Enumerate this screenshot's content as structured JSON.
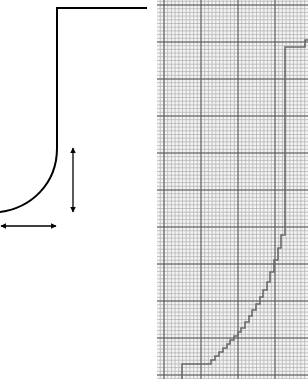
{
  "diagram": {
    "left_panel": {
      "description": "Smooth profile: horizontal top edge, vertical wall, rounded fillet curving into bottom",
      "stroke_color": "#000000",
      "profile": {
        "top_line": {
          "x1": 57,
          "y1": 8,
          "x2": 147,
          "y2": 8
        },
        "wall": {
          "x1": 57,
          "y1": 8,
          "x2": 57,
          "y2": 148
        },
        "fillet_end": {
          "x": 0,
          "y": 212
        }
      },
      "arrows": [
        {
          "name": "vertical-dimension-arrow",
          "orientation": "vertical",
          "x": 73,
          "y1": 146,
          "y2": 213
        },
        {
          "name": "horizontal-dimension-arrow",
          "orientation": "horizontal",
          "y": 226,
          "x1": 0,
          "x2": 57
        }
      ]
    },
    "right_panel": {
      "description": "Stepped (pixelated) approximation of the profile on graph paper",
      "grid": {
        "minor_color": "#b5b5b5",
        "major_color": "#555555",
        "minor_spacing": 3.7,
        "major_spacing": 37,
        "origin_x": 7,
        "origin_y": 5
      },
      "curve_color": "#6a6a6a",
      "stepped_curve": [
        [
          25,
          379
        ],
        [
          25,
          364
        ],
        [
          54,
          364
        ],
        [
          54,
          360
        ],
        [
          58,
          360
        ],
        [
          58,
          356
        ],
        [
          62,
          356
        ],
        [
          62,
          352
        ],
        [
          66,
          352
        ],
        [
          66,
          348
        ],
        [
          70,
          348
        ],
        [
          70,
          344
        ],
        [
          73,
          344
        ],
        [
          73,
          340
        ],
        [
          77,
          340
        ],
        [
          77,
          336
        ],
        [
          81,
          336
        ],
        [
          81,
          332
        ],
        [
          84,
          332
        ],
        [
          84,
          328
        ],
        [
          88,
          328
        ],
        [
          88,
          322
        ],
        [
          92,
          322
        ],
        [
          92,
          316
        ],
        [
          95,
          316
        ],
        [
          95,
          310
        ],
        [
          99,
          310
        ],
        [
          99,
          304
        ],
        [
          103,
          304
        ],
        [
          103,
          297
        ],
        [
          106,
          297
        ],
        [
          106,
          290
        ],
        [
          110,
          290
        ],
        [
          110,
          282
        ],
        [
          113,
          282
        ],
        [
          113,
          272
        ],
        [
          117,
          272
        ],
        [
          117,
          260
        ],
        [
          121,
          260
        ],
        [
          121,
          248
        ],
        [
          124,
          248
        ],
        [
          124,
          235
        ],
        [
          128,
          235
        ],
        [
          128,
          232
        ],
        [
          128,
          47
        ],
        [
          148,
          47
        ],
        [
          148,
          40
        ],
        [
          151,
          40
        ]
      ]
    }
  }
}
